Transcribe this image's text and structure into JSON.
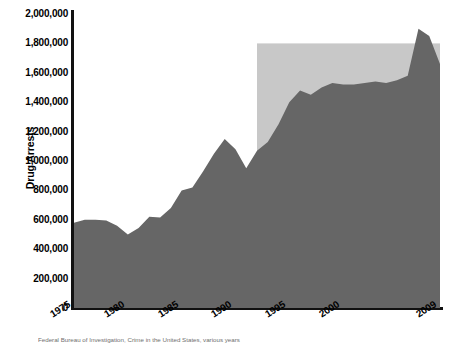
{
  "chart_data": {
    "type": "area",
    "title": "",
    "xlabel": "",
    "ylabel": "Drug Arrests",
    "xlim": [
      1975,
      2009
    ],
    "ylim": [
      0,
      2000000
    ],
    "grid": false,
    "legend_position": "none",
    "series": [
      {
        "name": "Drug Arrests",
        "color": "#666666",
        "x": [
          1975,
          1976,
          1977,
          1978,
          1979,
          1980,
          1981,
          1982,
          1983,
          1984,
          1985,
          1986,
          1987,
          1988,
          1989,
          1990,
          1991,
          1992,
          1993,
          1994,
          1995,
          1996,
          1997,
          1998,
          1999,
          2000,
          2001,
          2002,
          2003,
          2004,
          2005,
          2006,
          2007,
          2008,
          2009
        ],
        "values": [
          580000,
          600000,
          600000,
          595000,
          560000,
          500000,
          545000,
          620000,
          615000,
          680000,
          800000,
          820000,
          930000,
          1050000,
          1150000,
          1080000,
          950000,
          1070000,
          1130000,
          1250000,
          1400000,
          1480000,
          1450000,
          1500000,
          1530000,
          1520000,
          1520000,
          1530000,
          1540000,
          1530000,
          1550000,
          1580000,
          1900000,
          1850000,
          1660000
        ]
      }
    ],
    "shaded_region": {
      "label": "",
      "color": "#c8c8c8",
      "x_start": 1992,
      "x_end": 2009,
      "y_top": 1800000
    },
    "y_ticks": [
      "2,000,000",
      "1,800,000",
      "1,600,000",
      "1,400,000",
      "1,200,000",
      "1,000,000",
      "800,000",
      "600,000",
      "400,000",
      "200,000",
      "0"
    ],
    "y_tick_values": [
      2000000,
      1800000,
      1600000,
      1400000,
      1200000,
      1000000,
      800000,
      600000,
      400000,
      200000,
      0
    ],
    "x_ticks": [
      "1975",
      "1980",
      "1985",
      "1990",
      "1995",
      "2000",
      "2009"
    ],
    "x_tick_values": [
      1975,
      1980,
      1985,
      1990,
      1995,
      2000,
      2009
    ]
  },
  "axis": {
    "y_title": "Drug Arrests"
  },
  "caption": {
    "source": "Federal Bureau of Investigation, Crime in the United States, various years"
  },
  "colors": {
    "area_fill": "#666666",
    "shaded_band": "#c8c8c8",
    "axis_line": "#111111",
    "text": "#000000",
    "background": "#ffffff"
  }
}
